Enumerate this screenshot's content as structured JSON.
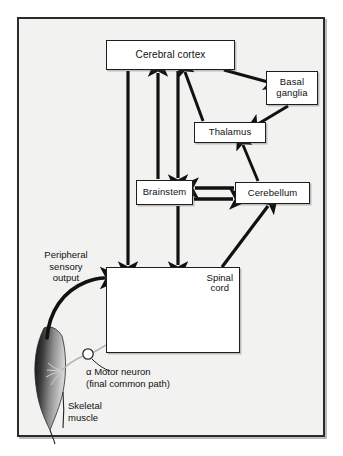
{
  "figure": {
    "background_color": "#f2f2f0",
    "frame_color": "#2b2b2b",
    "node_fill": "#ffffff",
    "ink_color": "#111111"
  },
  "nodes": {
    "cerebral_cortex": "Cerebral cortex",
    "basal_ganglia": "Basal\nganglia",
    "basal_ganglia_line1": "Basal",
    "basal_ganglia_line2": "ganglia",
    "thalamus": "Thalamus",
    "brainstem": "Brainstem",
    "cerebellum": "Cerebellum",
    "spinal_cord_line1": "Spinal",
    "spinal_cord_line2": "cord"
  },
  "labels": {
    "peripheral_sensory_output": "Peripheral\nsensory\noutput",
    "peripheral_line1": "Peripheral",
    "peripheral_line2": "sensory",
    "peripheral_line3": "output",
    "motor_neuron_line1": "α Motor neuron",
    "motor_neuron_line2": "(final common path)",
    "skeletal_muscle_line1": "Skeletal",
    "skeletal_muscle_line2": "muscle"
  },
  "connections": [
    {
      "from": "cerebral_cortex",
      "to": "basal_ganglia",
      "style": "arrow"
    },
    {
      "from": "basal_ganglia",
      "to": "thalamus",
      "style": "arrow"
    },
    {
      "from": "thalamus",
      "to": "cerebral_cortex",
      "style": "arrow"
    },
    {
      "from": "cerebellum",
      "to": "thalamus",
      "style": "arrow"
    },
    {
      "from": "cerebellum",
      "to": "brainstem",
      "style": "arrow"
    },
    {
      "from": "brainstem",
      "to": "cerebellum",
      "style": "arrow"
    },
    {
      "from": "brainstem",
      "to": "cerebral_cortex",
      "style": "arrow"
    },
    {
      "from": "cerebral_cortex",
      "to": "brainstem",
      "style": "arrow"
    },
    {
      "from": "cerebral_cortex",
      "to": "spinal_cord",
      "style": "arrow"
    },
    {
      "from": "brainstem",
      "to": "spinal_cord",
      "style": "arrow"
    },
    {
      "from": "spinal_cord",
      "to": "cerebellum",
      "style": "arrow"
    },
    {
      "from": "skeletal_muscle",
      "to": "spinal_cord",
      "style": "curved-arrow",
      "label": "peripheral_sensory_output"
    },
    {
      "from": "spinal_cord",
      "to": "skeletal_muscle",
      "style": "neuron-axon",
      "label": "motor_neuron_line1"
    }
  ],
  "illustrations": {
    "spinal_cord_section": "spinal-cord-cross-section",
    "skeletal_muscle": "muscle-spindle-shape",
    "motor_neuron_soma": "open-circle"
  }
}
